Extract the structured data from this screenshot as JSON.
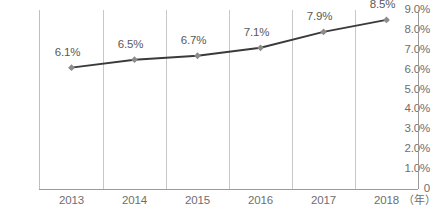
{
  "chart_data": {
    "type": "line",
    "title": "",
    "subtitle": "",
    "xlabel": "（年）",
    "ylabel": "",
    "categories": [
      "2013",
      "2014",
      "2015",
      "2016",
      "2017",
      "2018"
    ],
    "values": [
      6.1,
      6.5,
      6.7,
      7.1,
      7.9,
      8.5
    ],
    "point_labels": [
      "6.1%",
      "6.5%",
      "6.7%",
      "7.1%",
      "7.9%",
      "8.5%"
    ],
    "ylim": [
      0,
      9.0
    ],
    "ytick_labels": [
      "9.0%",
      "8.0%",
      "7.0%",
      "6.0%",
      "5.0%",
      "4.0%",
      "3.0%",
      "2.0%",
      "1.0%",
      "0"
    ],
    "ytick_values": [
      9.0,
      8.0,
      7.0,
      6.0,
      5.0,
      4.0,
      3.0,
      2.0,
      1.0,
      0
    ],
    "grid": {
      "vertical": true,
      "horizontal": false
    },
    "legend": {
      "visible": false,
      "position": "none"
    },
    "marker": "diamond",
    "series": [
      {
        "name": "",
        "values": [
          6.1,
          6.5,
          6.7,
          7.1,
          7.9,
          8.5
        ]
      }
    ],
    "colors": {
      "line": "#3a3a3a",
      "marker": "#8c8c8c",
      "grid": "#c8c8c8",
      "axis": "#9a9a9a",
      "tick_text": "#6e6e6e",
      "label_text": "#595959",
      "background": "#ffffff"
    }
  }
}
